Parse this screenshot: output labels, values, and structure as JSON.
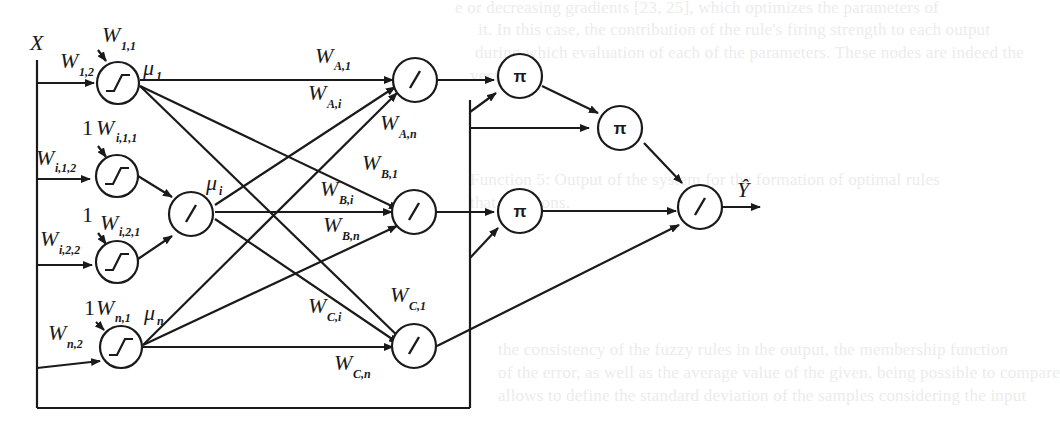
{
  "diagram": {
    "type": "neural-network-architecture",
    "input": {
      "label": "X"
    },
    "output": {
      "label": "Ŷ"
    },
    "background_text": [
      "e or decreasing gradients [23, 25], which optimizes the parameters of",
      "it. In this case, the contribution of the rule's firing strength to each output",
      "during which evaluation of each of the parameters. These nodes are indeed the",
      "vector.",
      "Function 5: Output of the system for the formation of optimal rules",
      "that functions.",
      "the consistency of the fuzzy rules in the output, the membership function",
      "of the error, as well as the average value of the given, being possible to compare",
      "allows to define the standard deviation of the samples considering the input"
    ],
    "layer1": {
      "nodes": [
        {
          "id": "n1",
          "symbol": "sigmoid",
          "weights": [
            {
              "base": "W",
              "sub": "1,1",
              "prefix": ""
            },
            {
              "base": "W",
              "sub": "1,2",
              "prefix": ""
            }
          ],
          "output_label": {
            "base": "μ",
            "sub": "1"
          }
        },
        {
          "id": "ni1",
          "symbol": "sigmoid",
          "weights": [
            {
              "base": "W",
              "sub": "i,1,1",
              "prefix": "1"
            },
            {
              "base": "W",
              "sub": "i,1,2",
              "prefix": ""
            }
          ]
        },
        {
          "id": "ni2",
          "symbol": "sigmoid",
          "weights": [
            {
              "base": "W",
              "sub": "i,2,1",
              "prefix": "1"
            },
            {
              "base": "W",
              "sub": "i,2,2",
              "prefix": ""
            }
          ]
        },
        {
          "id": "nn",
          "symbol": "sigmoid",
          "weights": [
            {
              "base": "W",
              "sub": "n,1",
              "prefix": "1"
            },
            {
              "base": "W",
              "sub": "n,2",
              "prefix": ""
            }
          ],
          "output_label": {
            "base": "μ",
            "sub": "n"
          }
        }
      ]
    },
    "layer2": {
      "nodes": [
        {
          "id": "ni",
          "symbol": "/",
          "output_label": {
            "base": "μ",
            "sub": "i"
          }
        }
      ]
    },
    "layer3": {
      "nodes": [
        {
          "id": "A",
          "symbol": "/",
          "weights": [
            {
              "base": "W",
              "sub": "A,1"
            },
            {
              "base": "W",
              "sub": "A,i"
            },
            {
              "base": "W",
              "sub": "A,n"
            }
          ]
        },
        {
          "id": "B",
          "symbol": "/",
          "weights": [
            {
              "base": "W",
              "sub": "B,1"
            },
            {
              "base": "W",
              "sub": "B,i"
            },
            {
              "base": "W",
              "sub": "B,n"
            }
          ]
        },
        {
          "id": "C",
          "symbol": "/",
          "weights": [
            {
              "base": "W",
              "sub": "C,1"
            },
            {
              "base": "W",
              "sub": "C,i"
            },
            {
              "base": "W",
              "sub": "C,n"
            }
          ]
        }
      ]
    },
    "layer4": {
      "nodes": [
        {
          "id": "p1",
          "symbol": "π"
        },
        {
          "id": "p2",
          "symbol": "π"
        },
        {
          "id": "p3",
          "symbol": "π"
        }
      ]
    },
    "output_node": {
      "id": "out",
      "symbol": "/"
    },
    "colors": {
      "line": "#1a1a1a",
      "background": "#ffffff",
      "ghost_text": "#ececec"
    }
  }
}
